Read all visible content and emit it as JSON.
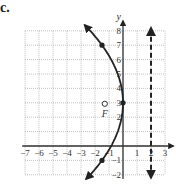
{
  "panel": {
    "label": "c."
  },
  "chart_data": {
    "type": "line",
    "title": "",
    "xlabel": "",
    "ylabel": "y",
    "xlim": [
      -7.2,
      3.5
    ],
    "ylim": [
      -2.3,
      8.6
    ],
    "grid": true,
    "x_ticks": [
      "−7",
      "−6",
      "−5",
      "−4",
      "−3",
      "−2",
      "−1",
      "1",
      "2",
      "3"
    ],
    "y_ticks": [
      "−2",
      "−1",
      "2",
      "3",
      "4",
      "5",
      "6",
      "7",
      "8"
    ],
    "series": [
      {
        "name": "parabola",
        "equation": "(y-3)^2 = -8x",
        "vertex": [
          0,
          3
        ],
        "opens": "left",
        "style": "solid",
        "marked_points": [
          [
            -2,
            7
          ],
          [
            0,
            3
          ],
          [
            -2,
            -1
          ]
        ]
      },
      {
        "name": "directrix",
        "equation": "x = 2",
        "style": "dashed",
        "arrows": "both"
      }
    ],
    "annotations": [
      {
        "text": "F",
        "point": [
          -2,
          3
        ],
        "marker": "open-circle",
        "meaning": "focus"
      }
    ]
  }
}
